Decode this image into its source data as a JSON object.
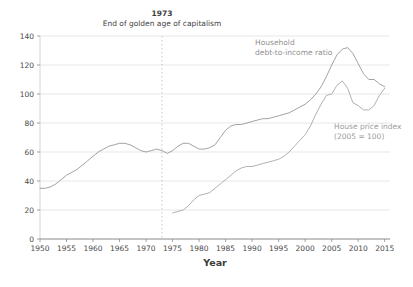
{
  "colors": {
    "background": "#ffffff",
    "grid": "#dcdcdc",
    "axis": "#8a8a8a",
    "axis_light": "#c9c9c9",
    "dashed_line": "#c2c2c2",
    "tick_text": "#4a4a4a",
    "annotation_text": "#3f3f3f",
    "debt_line": "#979797",
    "hpi_line": "#a8a8a8"
  },
  "chart_data": {
    "type": "line",
    "xlabel": "Year",
    "ylabel": "",
    "xlim": [
      1950,
      2016
    ],
    "ylim": [
      0,
      140
    ],
    "grid": true,
    "x_ticks": [
      1950,
      1955,
      1960,
      1965,
      1970,
      1975,
      1980,
      1985,
      1990,
      1995,
      2000,
      2005,
      2010,
      2015
    ],
    "y_ticks": [
      0,
      20,
      40,
      60,
      80,
      100,
      120,
      140
    ],
    "annotation": {
      "x_year": 1973,
      "title": "1973",
      "text": "End of golden age of capitalism"
    },
    "series": [
      {
        "name": "Household debt-to-income ratio",
        "label_lines": [
          "Household",
          "debt-to-income ratio"
        ],
        "color": "#979797",
        "x_start": 1950,
        "values": [
          35,
          35,
          36,
          38,
          41,
          44,
          46,
          48,
          51,
          54,
          57,
          60,
          62,
          64,
          65,
          66,
          66,
          65,
          63,
          61,
          60,
          61,
          62,
          61,
          59,
          61,
          64,
          66,
          66,
          64,
          62,
          62,
          63,
          65,
          70,
          75,
          78,
          79,
          79,
          80,
          81,
          82,
          83,
          83,
          84,
          85,
          86,
          87,
          89,
          91,
          93,
          96,
          100,
          105,
          112,
          120,
          127,
          131,
          132,
          128,
          121,
          114,
          110,
          110,
          107,
          105
        ]
      },
      {
        "name": "House price index (2005 = 100)",
        "label_lines": [
          "House price index",
          "(2005 = 100)"
        ],
        "color": "#a8a8a8",
        "x_start": 1975,
        "values": [
          18,
          19,
          20,
          23,
          27,
          30,
          31,
          32,
          35,
          38,
          41,
          44,
          47,
          49,
          50,
          50,
          51,
          52,
          53,
          54,
          55,
          57,
          60,
          64,
          68,
          72,
          78,
          86,
          93,
          99,
          100,
          106,
          109,
          104,
          94,
          92,
          89,
          89,
          92,
          99,
          104
        ]
      }
    ]
  }
}
